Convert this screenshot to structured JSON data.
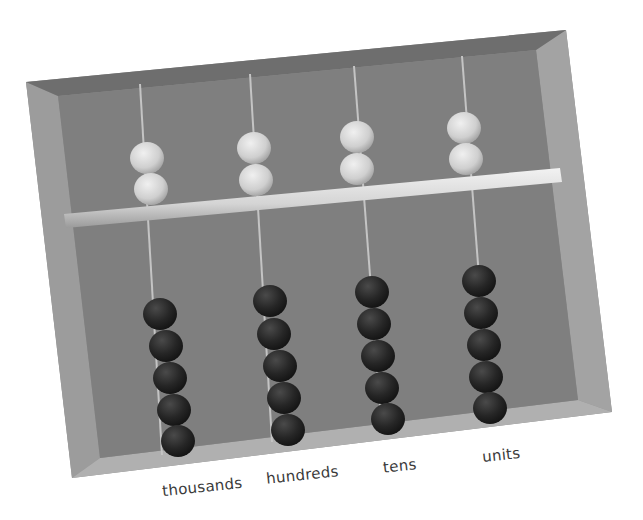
{
  "image": {
    "subject": "cardboard-abacus",
    "colors": {
      "background": "#ffffff",
      "cardboard_outer": "#8e8e8e",
      "cardboard_inner": "#7d7d7d",
      "cardboard_edge": "#a6a6a6",
      "rod": "#d8d8d8",
      "light_bead": "#d6d6d6",
      "dark_bead": "#262626",
      "wire": "#bdbdbd"
    }
  },
  "columns": [
    {
      "label": "thousands",
      "upper_beads": 2,
      "lower_beads": 5
    },
    {
      "label": "hundreds",
      "upper_beads": 2,
      "lower_beads": 5
    },
    {
      "label": "tens",
      "upper_beads": 2,
      "lower_beads": 5
    },
    {
      "label": "units",
      "upper_beads": 2,
      "lower_beads": 5
    }
  ]
}
